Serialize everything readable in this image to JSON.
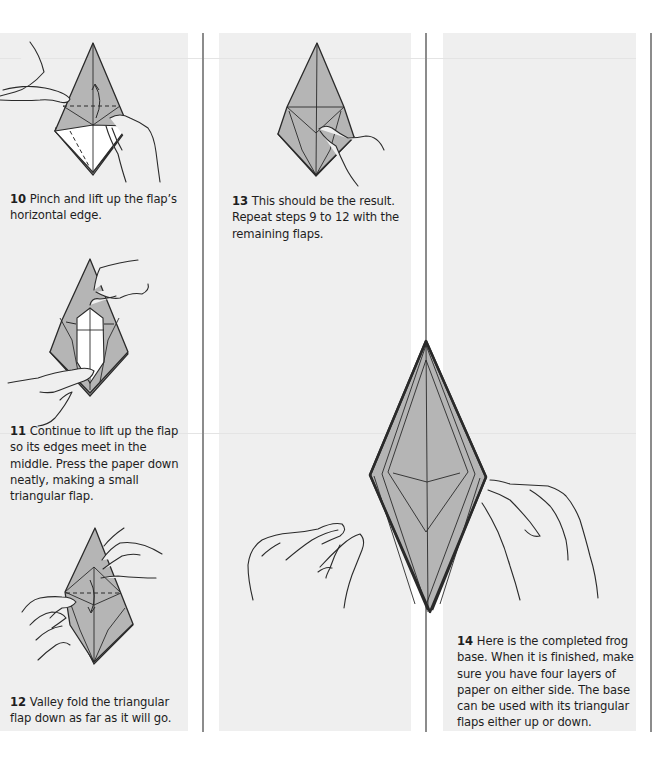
{
  "page": {
    "columns": 3,
    "panel_color": "#efefef",
    "paper_color": "#b5b5b5",
    "divider_color": "#8c8c8c"
  },
  "steps": [
    {
      "number": "10",
      "text": "Pinch and lift up the flap’s horizontal edge.",
      "illustration": "hand-lifting-flap-icon"
    },
    {
      "number": "11",
      "text": "Continue to lift up the flap so its edges meet in the middle. Press the paper down neatly, making a small triangular flap.",
      "illustration": "hands-squashing-flap-icon"
    },
    {
      "number": "12",
      "text": "Valley fold the triangular flap down as far as it will go.",
      "illustration": "valley-fold-icon"
    },
    {
      "number": "13",
      "text": "This should be the result. Repeat steps 9 to 12 with the remaining flaps.",
      "illustration": "result-model-icon"
    },
    {
      "number": "14",
      "text": "Here is the completed frog base. When it is finished, make sure you have four layers of paper on either side. The base can be used with its triangular flaps either up or down.",
      "illustration": "completed-frog-base-icon"
    }
  ]
}
